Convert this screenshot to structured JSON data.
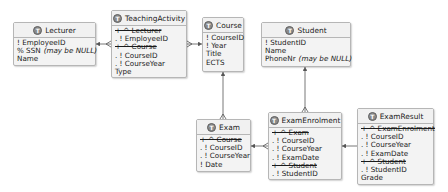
{
  "diagram": {
    "type": "entity-relationship",
    "colors": {
      "box_fill": "#f3f3f3",
      "box_border": "#b6b6b6",
      "icon_fill": "#8a8a8a",
      "line": "#555555"
    },
    "entities": {
      "lecturer": {
        "title": "Lecturer",
        "icon": "T",
        "rows": [
          {
            "text": "! EmployeeID",
            "strike": false
          },
          {
            "text": "% SSN",
            "note": "(may be NULL)",
            "strike": false
          },
          {
            "text": "Name",
            "strike": false
          }
        ]
      },
      "teaching_activity": {
        "title": "TeachingActivity",
        "icon": "T",
        "rows": [
          {
            "text": "+ ^ Lecturer",
            "strike": true
          },
          {
            "text": ". ! EmployeeID",
            "strike": false
          },
          {
            "text": "+ ^ Course",
            "strike": true
          },
          {
            "text": ". ! CourseID",
            "strike": false
          },
          {
            "text": ". ! CourseYear",
            "strike": false
          },
          {
            "text": "Type",
            "strike": false
          }
        ]
      },
      "course": {
        "title": "Course",
        "icon": "T",
        "rows": [
          {
            "text": "! CourseID",
            "strike": false
          },
          {
            "text": "! Year",
            "strike": false
          },
          {
            "text": "Title",
            "strike": false
          },
          {
            "text": "ECTS",
            "strike": false
          }
        ]
      },
      "student": {
        "title": "Student",
        "icon": "T",
        "rows": [
          {
            "text": "! StudentID",
            "strike": false
          },
          {
            "text": "Name",
            "strike": false
          },
          {
            "text": "PhoneNr",
            "note": "(may be NULL)",
            "strike": false
          }
        ]
      },
      "exam": {
        "title": "Exam",
        "icon": "T",
        "rows": [
          {
            "text": "+ ^ Course",
            "strike": true
          },
          {
            "text": ". ! CourseID",
            "strike": false
          },
          {
            "text": ". ! CourseYear",
            "strike": false
          },
          {
            "text": "! Date",
            "strike": false
          }
        ]
      },
      "exam_enrolment": {
        "title": "ExamEnrolment",
        "icon": "T",
        "rows": [
          {
            "text": "+ ^ Exam",
            "strike": true
          },
          {
            "text": ". ! CourseID",
            "strike": false
          },
          {
            "text": ". ! CourseYear",
            "strike": false
          },
          {
            "text": ". ! ExamDate",
            "strike": false
          },
          {
            "text": "+ ^ Student",
            "strike": true
          },
          {
            "text": ". ! StudentID",
            "strike": false
          }
        ]
      },
      "exam_result": {
        "title": "ExamResult",
        "icon": "T",
        "rows": [
          {
            "text": "+ ^ ExamEnrolment",
            "strike": true
          },
          {
            "text": ". ! CourseID",
            "strike": false
          },
          {
            "text": ". ! CourseYear",
            "strike": false
          },
          {
            "text": ". ! ExamDate",
            "strike": false
          },
          {
            "text": "+ ^ Student",
            "strike": true
          },
          {
            "text": ". ! StudentID",
            "strike": false
          },
          {
            "text": "Grade",
            "strike": false
          }
        ]
      }
    },
    "relationships": [
      {
        "from": "TeachingActivity",
        "to": "Lecturer"
      },
      {
        "from": "TeachingActivity",
        "to": "Course"
      },
      {
        "from": "Exam",
        "to": "Course"
      },
      {
        "from": "ExamEnrolment",
        "to": "Student"
      },
      {
        "from": "ExamEnrolment",
        "to": "Exam"
      },
      {
        "from": "ExamResult",
        "to": "ExamEnrolment"
      }
    ]
  }
}
